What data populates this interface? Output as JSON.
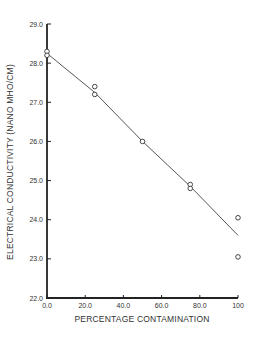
{
  "chart_data": {
    "type": "scatter",
    "title": "",
    "xlabel": "PERCENTAGE CONTAMINATION",
    "ylabel": "ELECTRICAL CONDUCTIVITY (NANO MHO/CM)",
    "xlim": [
      0,
      100
    ],
    "ylim": [
      22.0,
      29.0
    ],
    "x_ticks": [
      0,
      20,
      40,
      60,
      80,
      100
    ],
    "x_tick_labels": [
      "0.0",
      "20.0",
      "40.0",
      "60.0",
      "80.0",
      "100"
    ],
    "y_ticks": [
      22,
      23,
      24,
      25,
      26,
      27,
      28,
      29
    ],
    "y_tick_labels": [
      "22.0",
      "23.0",
      "24.0",
      "25.0",
      "26.0",
      "27.0",
      "28.0",
      "29.0"
    ],
    "grid": false,
    "legend": null,
    "series": [
      {
        "name": "measured",
        "marker": "open-circle",
        "points": [
          {
            "x": 0,
            "y": 28.3
          },
          {
            "x": 0,
            "y": 28.2
          },
          {
            "x": 25,
            "y": 27.4
          },
          {
            "x": 25,
            "y": 27.2
          },
          {
            "x": 50,
            "y": 26.0
          },
          {
            "x": 75,
            "y": 24.9
          },
          {
            "x": 75,
            "y": 24.8
          },
          {
            "x": 100,
            "y": 24.05
          },
          {
            "x": 100,
            "y": 23.05
          }
        ]
      },
      {
        "name": "fit",
        "type": "line",
        "points": [
          {
            "x": 0,
            "y": 28.25
          },
          {
            "x": 25,
            "y": 27.25
          },
          {
            "x": 50,
            "y": 26.0
          },
          {
            "x": 75,
            "y": 24.85
          },
          {
            "x": 100,
            "y": 23.6
          }
        ]
      }
    ]
  },
  "colors": {
    "axis": "#222222",
    "line": "#444444",
    "marker": "#333333",
    "text": "#333333"
  }
}
